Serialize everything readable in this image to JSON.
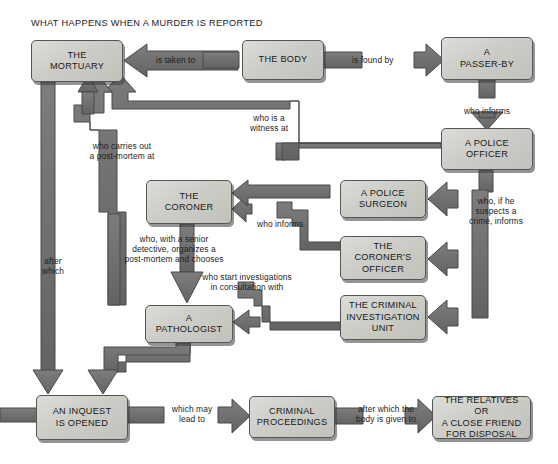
{
  "diagram": {
    "title": "WHAT HAPPENS WHEN A MURDER IS REPORTED",
    "type": "flowchart",
    "palette": {
      "box_fill": "#cfcfcb",
      "box_border": "#555555",
      "arrow_fill": "#6e6e6e",
      "arrow_stroke": "#4a4a4a",
      "background": "#ffffff",
      "text": "#1a1a1a"
    },
    "nodes": [
      {
        "id": "mortuary",
        "label": "THE\nMORTUARY",
        "x": 31,
        "y": 40,
        "w": 92,
        "h": 42
      },
      {
        "id": "body",
        "label": "THE BODY",
        "x": 242,
        "y": 40,
        "w": 82,
        "h": 40
      },
      {
        "id": "passerby",
        "label": "A\nPASSER-BY",
        "x": 441,
        "y": 37,
        "w": 92,
        "h": 43
      },
      {
        "id": "police_officer",
        "label": "A POLICE\nOFFICER",
        "x": 441,
        "y": 128,
        "w": 92,
        "h": 42
      },
      {
        "id": "coroner",
        "label": "THE\nCORONER",
        "x": 146,
        "y": 180,
        "w": 86,
        "h": 44
      },
      {
        "id": "police_surgeon",
        "label": "A POLICE\nSURGEON",
        "x": 340,
        "y": 180,
        "w": 86,
        "h": 38
      },
      {
        "id": "coroners_officer",
        "label": "THE\nCORONER'S\nOFFICER",
        "x": 340,
        "y": 236,
        "w": 86,
        "h": 44
      },
      {
        "id": "ciu",
        "label": "THE CRIMINAL\nINVESTIGATION\nUNIT",
        "x": 340,
        "y": 295,
        "w": 86,
        "h": 45
      },
      {
        "id": "pathologist",
        "label": "A\nPATHOLOGIST",
        "x": 145,
        "y": 305,
        "w": 88,
        "h": 38
      },
      {
        "id": "inquest",
        "label": "AN INQUEST\nIS OPENED",
        "x": 36,
        "y": 395,
        "w": 92,
        "h": 45
      },
      {
        "id": "criminal_proceedings",
        "label": "CRIMINAL\nPROCEEDINGS",
        "x": 249,
        "y": 396,
        "w": 86,
        "h": 42
      },
      {
        "id": "relatives",
        "label": "THE RELATIVES OR\nA CLOSE FRIEND\nFOR DISPOSAL",
        "x": 432,
        "y": 396,
        "w": 99,
        "h": 43
      }
    ],
    "connectors": [
      {
        "id": "body-to-mortuary",
        "label": "is taken to",
        "from": "body",
        "to": "mortuary",
        "x": 156,
        "y": 55,
        "w": 70,
        "align": "left"
      },
      {
        "id": "body-found-by-passerby",
        "label": "is found by",
        "from": "body",
        "to": "passerby",
        "x": 352,
        "y": 55,
        "w": 70,
        "align": "left"
      },
      {
        "id": "passerby-informs-police",
        "label": "who informs",
        "from": "passerby",
        "to": "police_officer",
        "x": 452,
        "y": 106,
        "w": 70,
        "align": "center"
      },
      {
        "id": "police-witness-mortuary",
        "label": "who is a\nwitness at",
        "from": "police_officer",
        "to": "mortuary",
        "x": 234,
        "y": 113,
        "w": 70,
        "align": "center"
      },
      {
        "id": "pathologist-postmortem",
        "label": "who carries out\na post-mortem at",
        "from": "pathologist",
        "to": "mortuary",
        "x": 74,
        "y": 141,
        "w": 96,
        "align": "center"
      },
      {
        "id": "police-suspects-crime",
        "label": "who, if he\nsuspects a\ncrime, informs",
        "from": "police_officer",
        "to": "ciu",
        "x": 456,
        "y": 196,
        "w": 80,
        "align": "center"
      },
      {
        "id": "coroners-officer-informs",
        "label": "who informs",
        "from": "coroners_officer",
        "to": "coroner",
        "x": 257,
        "y": 219,
        "w": 60,
        "align": "left"
      },
      {
        "id": "coroner-chooses",
        "label": "who, with a senior\ndetective, organizes a\npost-mortem and chooses",
        "from": "coroner",
        "to": "pathologist",
        "x": 108,
        "y": 234,
        "w": 132,
        "align": "center"
      },
      {
        "id": "ciu-investigations",
        "label": "who start investigations\nin consultation with",
        "from": "ciu",
        "to": "pathologist",
        "x": 183,
        "y": 272,
        "w": 128,
        "align": "center"
      },
      {
        "id": "after-which-inquest",
        "label": "after\nwhich",
        "from": "mortuary",
        "to": "inquest",
        "x": 33,
        "y": 256,
        "w": 40,
        "align": "center"
      },
      {
        "id": "inquest-may-lead-to",
        "label": "which may\nlead to",
        "from": "inquest",
        "to": "criminal_proceedings",
        "x": 157,
        "y": 404,
        "w": 70,
        "align": "center"
      },
      {
        "id": "body-given-to-relatives",
        "label": "after which the\nbody is given to",
        "from": "criminal_proceedings",
        "to": "relatives",
        "x": 347,
        "y": 404,
        "w": 78,
        "align": "center"
      }
    ]
  }
}
